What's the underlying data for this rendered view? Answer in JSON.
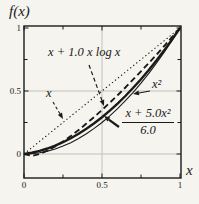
{
  "figure": {
    "background_color": "#f5f4ef",
    "ink_color": "#1a1a1a",
    "grid_color": "#bcbcb4"
  },
  "chart_data": {
    "type": "line",
    "title": "",
    "xlabel": "x",
    "ylabel": "f(x)",
    "xlim": [
      0,
      1
    ],
    "ylim": [
      -0.19,
      1.02
    ],
    "grid": {
      "x": [
        0.5
      ],
      "y": [
        0,
        0.5
      ]
    },
    "xticks": [
      {
        "value": 0,
        "label": "0"
      },
      {
        "value": 0.5,
        "label": "0.5"
      },
      {
        "value": 1,
        "label": "1"
      }
    ],
    "yticks": [
      {
        "value": 0,
        "label": "0"
      },
      {
        "value": 0.5,
        "label": "0.5"
      },
      {
        "value": 1,
        "label": "1"
      }
    ],
    "minor_xticks": [
      0.25,
      0.75
    ],
    "minor_yticks": [
      0.25,
      0.75
    ],
    "legend_position": "annotations-with-arrows",
    "x_samples": [
      0,
      0.05,
      0.1,
      0.15,
      0.2,
      0.25,
      0.3,
      0.35,
      0.4,
      0.45,
      0.5,
      0.55,
      0.6,
      0.65,
      0.7,
      0.75,
      0.8,
      0.85,
      0.9,
      0.95,
      1
    ],
    "series": [
      {
        "name": "x",
        "style": "dotted",
        "y": [
          0,
          0.05,
          0.1,
          0.15,
          0.2,
          0.25,
          0.3,
          0.35,
          0.4,
          0.45,
          0.5,
          0.55,
          0.6,
          0.65,
          0.7,
          0.75,
          0.8,
          0.85,
          0.9,
          0.95,
          1
        ]
      },
      {
        "name": "x + 1.0 x log x",
        "style": "dashed",
        "y": [
          0,
          -0.015,
          0,
          0.026,
          0.06,
          0.099,
          0.143,
          0.19,
          0.241,
          0.294,
          0.349,
          0.407,
          0.467,
          0.528,
          0.592,
          0.656,
          0.722,
          0.79,
          0.859,
          0.929,
          1
        ]
      },
      {
        "name": "x^2",
        "style": "solid-thin",
        "y": [
          0,
          0.003,
          0.01,
          0.023,
          0.04,
          0.063,
          0.09,
          0.123,
          0.16,
          0.203,
          0.25,
          0.303,
          0.36,
          0.423,
          0.49,
          0.563,
          0.64,
          0.723,
          0.81,
          0.903,
          1
        ]
      },
      {
        "name": "(x + 5.0x^2)/6.0",
        "style": "solid-thick",
        "y": [
          0,
          0.01,
          0.025,
          0.044,
          0.067,
          0.094,
          0.125,
          0.16,
          0.2,
          0.244,
          0.292,
          0.344,
          0.4,
          0.46,
          0.525,
          0.594,
          0.667,
          0.744,
          0.825,
          0.91,
          1
        ]
      }
    ],
    "annotations": [
      {
        "text": "x + 1.0 x log x",
        "target_series": "x + 1.0 x log x",
        "arrow": "dashed"
      },
      {
        "text": "x²",
        "target_series": "x^2",
        "arrow": "solid"
      },
      {
        "text": "x",
        "target_series": "x",
        "arrow": "dashed"
      },
      {
        "text_numerator": "x + 5.0x²",
        "text_denominator": "6.0",
        "target_series": "(x + 5.0x^2)/6.0",
        "arrow": "solid-thick"
      }
    ]
  }
}
